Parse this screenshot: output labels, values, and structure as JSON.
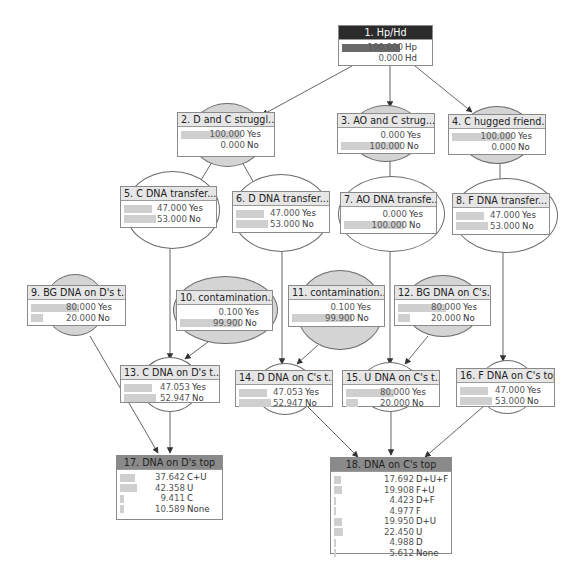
{
  "diagram": {
    "nodes": [
      {
        "id": 1,
        "title": "1. Hp/Hd",
        "type": "evidence",
        "shape": "none",
        "box": [
          338,
          25,
          95,
          41
        ],
        "states": [
          {
            "label": "Hp",
            "value": "100.000",
            "pct": 100
          },
          {
            "label": "Hd",
            "value": "0.000",
            "pct": 0
          }
        ]
      },
      {
        "id": 2,
        "title": "2. D and  C struggl...",
        "type": "shaded",
        "shape": "ellipse",
        "ellipse": [
          190,
          103,
          75,
          64
        ],
        "box": [
          177,
          112,
          98,
          45
        ],
        "states": [
          {
            "label": "Yes",
            "value": "100.000",
            "pct": 100
          },
          {
            "label": "No",
            "value": "0.000",
            "pct": 0
          }
        ]
      },
      {
        "id": 3,
        "title": "3. AO and  C strug...",
        "type": "shaded",
        "shape": "ellipse",
        "ellipse": [
          350,
          105,
          72,
          57
        ],
        "box": [
          337,
          113,
          98,
          41
        ],
        "states": [
          {
            "label": "Yes",
            "value": "0.000",
            "pct": 0
          },
          {
            "label": "No",
            "value": "100.000",
            "pct": 100
          }
        ]
      },
      {
        "id": 4,
        "title": "4. C hugged friend...",
        "type": "shaded",
        "shape": "ellipse",
        "ellipse": [
          460,
          106,
          74,
          58
        ],
        "box": [
          448,
          114,
          98,
          41
        ],
        "states": [
          {
            "label": "Yes",
            "value": "100.000",
            "pct": 100
          },
          {
            "label": "No",
            "value": "0.000",
            "pct": 0
          }
        ]
      },
      {
        "id": 5,
        "title": "5. C DNA transfer...",
        "type": "plain",
        "shape": "ellipse",
        "ellipse": [
          125,
          171,
          95,
          78
        ],
        "box": [
          120,
          186,
          97,
          42
        ],
        "states": [
          {
            "label": "Yes",
            "value": "47.000",
            "pct": 47
          },
          {
            "label": "No",
            "value": "53.000",
            "pct": 53
          }
        ]
      },
      {
        "id": 6,
        "title": "6. D DNA transfer...",
        "type": "plain",
        "shape": "ellipse",
        "ellipse": [
          232,
          174,
          98,
          78
        ],
        "box": [
          232,
          191,
          98,
          42
        ],
        "states": [
          {
            "label": "Yes",
            "value": "47.000",
            "pct": 47
          },
          {
            "label": "No",
            "value": "53.000",
            "pct": 53
          }
        ]
      },
      {
        "id": 7,
        "title": "7. AO DNA transfe...",
        "type": "plain",
        "shape": "ellipse",
        "ellipse": [
          338,
          176,
          107,
          76
        ],
        "box": [
          340,
          192,
          97,
          42
        ],
        "states": [
          {
            "label": "Yes",
            "value": "0.000",
            "pct": 0
          },
          {
            "label": "No",
            "value": "100.000",
            "pct": 100
          }
        ]
      },
      {
        "id": 8,
        "title": "8. F DNA transfer...",
        "type": "plain",
        "shape": "ellipse",
        "ellipse": [
          453,
          178,
          105,
          75
        ],
        "box": [
          452,
          193,
          98,
          42
        ],
        "states": [
          {
            "label": "Yes",
            "value": "47.000",
            "pct": 47
          },
          {
            "label": "No",
            "value": "53.000",
            "pct": 53
          }
        ]
      },
      {
        "id": 9,
        "title": "9. BG DNA on D's t...",
        "type": "shaded",
        "shape": "ellipse",
        "ellipse": [
          44,
          274,
          62,
          62
        ],
        "box": [
          27,
          285,
          99,
          41
        ],
        "states": [
          {
            "label": "Yes",
            "value": "80.000",
            "pct": 80
          },
          {
            "label": "No",
            "value": "20.000",
            "pct": 20
          }
        ]
      },
      {
        "id": 10,
        "title": "10. contamination...",
        "type": "shaded",
        "shape": "ellipse",
        "ellipse": [
          173,
          276,
          105,
          68
        ],
        "box": [
          176,
          290,
          97,
          41
        ],
        "states": [
          {
            "label": "Yes",
            "value": "0.100",
            "pct": 0.1
          },
          {
            "label": "No",
            "value": "99.900",
            "pct": 99.9
          }
        ]
      },
      {
        "id": 11,
        "title": "11. contamination...",
        "type": "shaded",
        "shape": "ellipse",
        "ellipse": [
          296,
          270,
          88,
          80
        ],
        "box": [
          288,
          285,
          97,
          42
        ],
        "states": [
          {
            "label": "Yes",
            "value": "0.100",
            "pct": 0.1
          },
          {
            "label": "No",
            "value": "99.900",
            "pct": 99.9
          }
        ]
      },
      {
        "id": 12,
        "title": "12. BG DNA on C's...",
        "type": "shaded",
        "shape": "ellipse",
        "ellipse": [
          404,
          275,
          78,
          62
        ],
        "box": [
          394,
          285,
          97,
          41
        ],
        "states": [
          {
            "label": "Yes",
            "value": "80.000",
            "pct": 80
          },
          {
            "label": "No",
            "value": "20.000",
            "pct": 20
          }
        ]
      },
      {
        "id": 13,
        "title": "13. C DNA on D's t...",
        "type": "plain",
        "shape": "ellipse",
        "ellipse": [
          140,
          357,
          60,
          55
        ],
        "box": [
          120,
          365,
          100,
          38
        ],
        "states": [
          {
            "label": "Yes",
            "value": "47.053",
            "pct": 47.053
          },
          {
            "label": "No",
            "value": "52.947",
            "pct": 52.947
          }
        ]
      },
      {
        "id": 14,
        "title": "14. D DNA on C's t...",
        "type": "plain",
        "shape": "ellipse",
        "ellipse": [
          255,
          363,
          60,
          52
        ],
        "box": [
          235,
          370,
          98,
          37
        ],
        "states": [
          {
            "label": "Yes",
            "value": "47.053",
            "pct": 47.053
          },
          {
            "label": "No",
            "value": "52.947",
            "pct": 52.947
          }
        ]
      },
      {
        "id": 15,
        "title": "15. U DNA on C's t...",
        "type": "plain",
        "shape": "ellipse",
        "ellipse": [
          360,
          362,
          60,
          50
        ],
        "box": [
          342,
          370,
          98,
          37
        ],
        "states": [
          {
            "label": "Yes",
            "value": "80.000",
            "pct": 80
          },
          {
            "label": "No",
            "value": "20.000",
            "pct": 20
          }
        ]
      },
      {
        "id": 16,
        "title": "16. F DNA on C's top",
        "type": "plain",
        "shape": "ellipse",
        "ellipse": [
          478,
          360,
          58,
          54
        ],
        "box": [
          456,
          368,
          99,
          39
        ],
        "states": [
          {
            "label": "Yes",
            "value": "47.000",
            "pct": 47
          },
          {
            "label": "No",
            "value": "53.000",
            "pct": 53
          }
        ]
      },
      {
        "id": 17,
        "title": "17. DNA on  D's top",
        "type": "query",
        "shape": "none",
        "box": [
          116,
          455,
          107,
          65
        ],
        "states": [
          {
            "label": "C+U",
            "value": "37.642",
            "pct": 37.642
          },
          {
            "label": "U",
            "value": "42.358",
            "pct": 42.358
          },
          {
            "label": "C",
            "value": "9.411",
            "pct": 9.411
          },
          {
            "label": "None",
            "value": "10.589",
            "pct": 10.589
          }
        ]
      },
      {
        "id": 18,
        "title": "18. DNA on  C's top",
        "type": "query",
        "shape": "none",
        "box": [
          330,
          457,
          122,
          97
        ],
        "states": [
          {
            "label": "D+U+F",
            "value": "17.692",
            "pct": 17.692
          },
          {
            "label": "F+U",
            "value": "19.908",
            "pct": 19.908
          },
          {
            "label": "D+F",
            "value": "4.423",
            "pct": 4.423
          },
          {
            "label": "F",
            "value": "4.977",
            "pct": 4.977
          },
          {
            "label": "D+U",
            "value": "19.950",
            "pct": 19.95
          },
          {
            "label": "U",
            "value": "22.450",
            "pct": 22.45
          },
          {
            "label": "D",
            "value": "4.988",
            "pct": 4.988
          },
          {
            "label": "None",
            "value": "5.612",
            "pct": 5.612
          }
        ]
      }
    ],
    "edges": [
      [
        1,
        2
      ],
      [
        1,
        3
      ],
      [
        1,
        4
      ],
      [
        2,
        5
      ],
      [
        2,
        6
      ],
      [
        3,
        7
      ],
      [
        4,
        8
      ],
      [
        5,
        13
      ],
      [
        10,
        13
      ],
      [
        6,
        14
      ],
      [
        11,
        14
      ],
      [
        7,
        15
      ],
      [
        12,
        15
      ],
      [
        8,
        16
      ],
      [
        9,
        17
      ],
      [
        13,
        17
      ],
      [
        14,
        18
      ],
      [
        15,
        18
      ],
      [
        16,
        18
      ]
    ],
    "edge_lines": [
      {
        "from": 1,
        "to": 2,
        "x1": 352,
        "y1": 66,
        "x2": 262,
        "y2": 115
      },
      {
        "from": 1,
        "to": 3,
        "x1": 390,
        "y1": 66,
        "x2": 390,
        "y2": 107
      },
      {
        "from": 1,
        "to": 4,
        "x1": 415,
        "y1": 66,
        "x2": 472,
        "y2": 112
      },
      {
        "from": 2,
        "to": 5,
        "x1": 212,
        "y1": 162,
        "x2": 192,
        "y2": 195
      },
      {
        "from": 2,
        "to": 6,
        "x1": 242,
        "y1": 162,
        "x2": 262,
        "y2": 197
      },
      {
        "from": 3,
        "to": 7,
        "x1": 390,
        "y1": 160,
        "x2": 390,
        "y2": 197
      },
      {
        "from": 4,
        "to": 8,
        "x1": 500,
        "y1": 162,
        "x2": 500,
        "y2": 198
      },
      {
        "from": 5,
        "to": 13,
        "x1": 170,
        "y1": 246,
        "x2": 170,
        "y2": 359
      },
      {
        "from": 10,
        "to": 13,
        "x1": 208,
        "y1": 342,
        "x2": 185,
        "y2": 359
      },
      {
        "from": 6,
        "to": 14,
        "x1": 282,
        "y1": 250,
        "x2": 282,
        "y2": 364
      },
      {
        "from": 11,
        "to": 14,
        "x1": 318,
        "y1": 345,
        "x2": 297,
        "y2": 364
      },
      {
        "from": 7,
        "to": 15,
        "x1": 390,
        "y1": 250,
        "x2": 390,
        "y2": 364
      },
      {
        "from": 12,
        "to": 15,
        "x1": 428,
        "y1": 336,
        "x2": 405,
        "y2": 364
      },
      {
        "from": 8,
        "to": 16,
        "x1": 503,
        "y1": 252,
        "x2": 503,
        "y2": 361
      },
      {
        "from": 9,
        "to": 17,
        "x1": 90,
        "y1": 336,
        "x2": 158,
        "y2": 453
      },
      {
        "from": 13,
        "to": 17,
        "x1": 170,
        "y1": 403,
        "x2": 170,
        "y2": 453
      },
      {
        "from": 14,
        "to": 18,
        "x1": 307,
        "y1": 406,
        "x2": 358,
        "y2": 457
      },
      {
        "from": 15,
        "to": 18,
        "x1": 391,
        "y1": 411,
        "x2": 391,
        "y2": 455
      },
      {
        "from": 16,
        "to": 18,
        "x1": 484,
        "y1": 406,
        "x2": 425,
        "y2": 457
      }
    ]
  }
}
